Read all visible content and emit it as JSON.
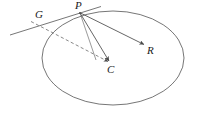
{
  "figure": {
    "kind": "geometry-diagram",
    "background_color": "#ffffff",
    "stroke_color": "#555555",
    "label_color": "#1a1a1a",
    "labels": {
      "tangent": "G",
      "point_on_circle": "P",
      "center": "C",
      "vector_end": "R"
    },
    "geometry": {
      "circle": {
        "cx": 113,
        "cy": 58,
        "rx": 71,
        "ry": 47
      },
      "point_P": {
        "x": 80,
        "y": 13
      },
      "point_C": {
        "x": 111,
        "y": 64
      },
      "point_R": {
        "x": 146,
        "y": 46
      },
      "point_G": {
        "x": 32,
        "y": 22
      },
      "tangent_line": {
        "x1": 10,
        "y1": 35,
        "x2": 100,
        "y2": 7
      },
      "dashed_line": {
        "x1": 31,
        "y1": 21,
        "x2": 109,
        "y2": 62
      }
    }
  }
}
